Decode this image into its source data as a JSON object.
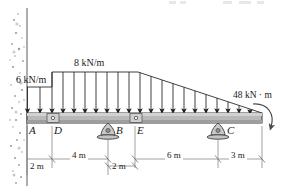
{
  "figure": {
    "type": "beam-free-body-diagram",
    "title": "",
    "colors": {
      "beam_fill": "#b9b9b9",
      "beam_stroke": "#3a3a3a",
      "line": "#2b2b2b",
      "wall_speckle": "#8d8d8d",
      "support_fill": "#c9c9c9",
      "dim_line": "#6f6f6f"
    }
  },
  "loads": {
    "left_udl": {
      "label": "6 kN/m",
      "value": 6,
      "unit": "kN/m",
      "from": "A",
      "to": "D"
    },
    "main_udl": {
      "label": "8 kN/m",
      "value": 8,
      "unit": "kN/m",
      "from": "D",
      "to": "taper-start"
    },
    "taper": {
      "start_value": 8,
      "end_value": 0,
      "unit": "kN/m",
      "to": "right-end"
    },
    "moment": {
      "label": "48 kN · m",
      "value": 48,
      "unit": "kN·m",
      "sense": "clockwise",
      "at": "right-end"
    }
  },
  "points": [
    {
      "id": "A",
      "label": "A",
      "x": 25,
      "kind": "wall-end"
    },
    {
      "id": "D",
      "label": "D",
      "x": 52,
      "kind": "internal-hinge"
    },
    {
      "id": "B",
      "label": "B",
      "x": 108,
      "kind": "rocker-support"
    },
    {
      "id": "E",
      "label": "E",
      "x": 135,
      "kind": "internal-hinge"
    },
    {
      "id": "C",
      "label": "C",
      "x": 218,
      "kind": "rocker-support"
    }
  ],
  "dimensions": [
    {
      "label": "2 m",
      "value": 2,
      "unit": "m",
      "from": "A",
      "to": "D"
    },
    {
      "label": "4 m",
      "value": 4,
      "unit": "m",
      "from": "D",
      "to": "B"
    },
    {
      "label": "2 m",
      "value": 2,
      "unit": "m",
      "from": "B",
      "to": "E"
    },
    {
      "label": "6 m",
      "value": 6,
      "unit": "m",
      "from": "E",
      "to": "C"
    },
    {
      "label": "3 m",
      "value": 3,
      "unit": "m",
      "from": "C",
      "to": "right-end"
    }
  ],
  "supports": {
    "wall": {
      "kind": "fixed-wall-hatched",
      "side": "left"
    },
    "rockers": [
      {
        "at": "B"
      },
      {
        "at": "C"
      }
    ]
  }
}
